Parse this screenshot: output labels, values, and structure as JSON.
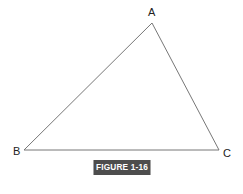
{
  "diagram": {
    "type": "triangle",
    "vertices": [
      {
        "label": "A",
        "x": 152,
        "y": 23
      },
      {
        "label": "B",
        "x": 24,
        "y": 150
      },
      {
        "label": "C",
        "x": 219,
        "y": 150
      }
    ],
    "stroke_color": "#777777",
    "caption": "FIGURE 1-16",
    "caption_bg": "#4d4d4d"
  }
}
